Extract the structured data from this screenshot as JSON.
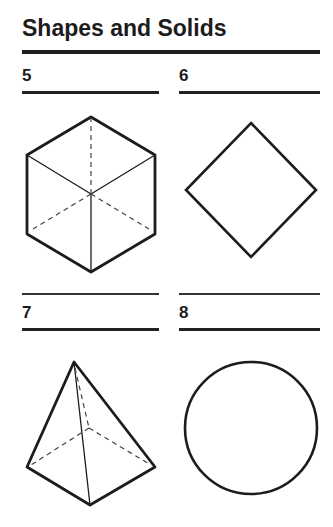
{
  "page": {
    "title": "Shapes and Solids"
  },
  "items": [
    {
      "number": "5",
      "shape": "cube",
      "description": "Cube drawn with hidden edges shown as dashed lines"
    },
    {
      "number": "6",
      "shape": "square",
      "description": "Square rotated 45 degrees (diamond orientation)"
    },
    {
      "number": "7",
      "shape": "square-pyramid",
      "description": "Square-based pyramid with hidden edges dashed"
    },
    {
      "number": "8",
      "shape": "circle",
      "description": "Circle"
    }
  ],
  "colors": {
    "ink": "#1c1c1c",
    "paper": "#ffffff"
  }
}
